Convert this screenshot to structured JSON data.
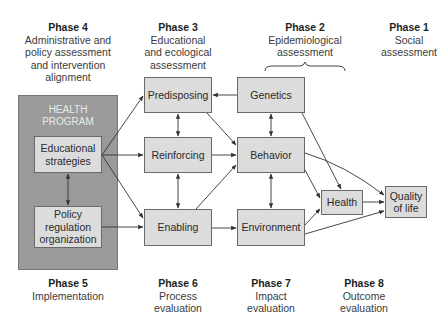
{
  "phases_top": [
    {
      "title": "Phase 4",
      "description": "Administrative and\npolicy assessment\nand intervention\nalignment"
    },
    {
      "title": "Phase 3",
      "description": "Educational\nand ecological\nassessment"
    },
    {
      "title": "Phase 2",
      "description": "Epidemiological\nassessment"
    },
    {
      "title": "Phase 1",
      "description": "Social\nassessment"
    }
  ],
  "phases_bottom": [
    {
      "title": "Phase 5",
      "description": "Implementation"
    },
    {
      "title": "Phase 6",
      "description": "Process\nevaluation"
    },
    {
      "title": "Phase 7",
      "description": "Impact\nevaluation"
    },
    {
      "title": "Phase 8",
      "description": "Outcome\nevaluation"
    }
  ],
  "health_program": {
    "title": "HEALTH\nPROGRAM",
    "boxes": {
      "educational_strategies": "Educational\nstrategies",
      "policy": "Policy\nregulation\norganization"
    }
  },
  "phase3_boxes": {
    "predisposing": "Predisposing",
    "reinforcing": "Reinforcing",
    "enabling": "Enabling"
  },
  "phase2_boxes": {
    "genetics": "Genetics",
    "behavior": "Behavior",
    "environment": "Environment",
    "health": "Health"
  },
  "phase1_boxes": {
    "quality_of_life": "Quality\nof life"
  },
  "colors": {
    "panel": "#9a9a9a",
    "box_fill": "#dcdcdc",
    "box_border": "#6a6a6a",
    "arrow": "#333333"
  },
  "connections": [
    {
      "from": "Educational strategies",
      "to": "Predisposing"
    },
    {
      "from": "Educational strategies",
      "to": "Reinforcing"
    },
    {
      "from": "Educational strategies",
      "to": "Enabling"
    },
    {
      "from": "Educational strategies",
      "to": "Policy regulation organization",
      "bidirectional": true
    },
    {
      "from": "Policy regulation organization",
      "to": "Enabling"
    },
    {
      "from": "Genetics",
      "to": "Predisposing"
    },
    {
      "from": "Predisposing",
      "to": "Reinforcing",
      "bidirectional": true
    },
    {
      "from": "Reinforcing",
      "to": "Enabling",
      "bidirectional": true
    },
    {
      "from": "Predisposing",
      "to": "Behavior"
    },
    {
      "from": "Reinforcing",
      "to": "Behavior"
    },
    {
      "from": "Enabling",
      "to": "Behavior"
    },
    {
      "from": "Enabling",
      "to": "Environment"
    },
    {
      "from": "Genetics",
      "to": "Behavior",
      "bidirectional": true
    },
    {
      "from": "Behavior",
      "to": "Environment",
      "bidirectional": true
    },
    {
      "from": "Genetics",
      "to": "Health"
    },
    {
      "from": "Behavior",
      "to": "Health"
    },
    {
      "from": "Environment",
      "to": "Health"
    },
    {
      "from": "Behavior",
      "to": "Quality of life"
    },
    {
      "from": "Health",
      "to": "Quality of life"
    },
    {
      "from": "Environment",
      "to": "Quality of life"
    }
  ]
}
